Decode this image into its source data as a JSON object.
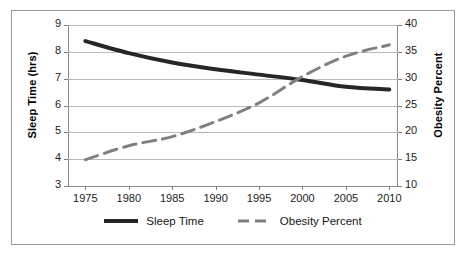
{
  "chart_data": {
    "type": "line",
    "title": "",
    "xlabel": "",
    "grid": true,
    "legend_position": "bottom",
    "x": [
      1975,
      1980,
      1985,
      1990,
      1995,
      2000,
      2005,
      2010
    ],
    "xlim": [
      1973,
      2011
    ],
    "xtick_labels": [
      "1975",
      "1980",
      "1985",
      "1990",
      "1995",
      "2000",
      "2005",
      "2010"
    ],
    "axes": [
      {
        "id": "left",
        "title": "Sleep Time (hrs)",
        "ylim": [
          3,
          9
        ],
        "ystep": 1,
        "ytick_labels": [
          "3",
          "4",
          "5",
          "6",
          "7",
          "8",
          "9"
        ]
      },
      {
        "id": "right",
        "title": "Obesity Percent",
        "ylim": [
          10,
          40
        ],
        "ystep": 5,
        "ytick_labels": [
          "10",
          "15",
          "20",
          "25",
          "30",
          "35",
          "40"
        ]
      }
    ],
    "series": [
      {
        "name": "Sleep Time",
        "axis": "left",
        "style": "solid",
        "color": "#262626",
        "width": 4,
        "values": [
          8.4,
          7.95,
          7.6,
          7.35,
          7.15,
          6.95,
          6.7,
          6.6
        ]
      },
      {
        "name": "Obesity Percent",
        "axis": "right",
        "style": "dashed",
        "color": "#808080",
        "width": 3,
        "values": [
          14.9,
          17.5,
          19.2,
          22.0,
          25.5,
          30.4,
          34.2,
          36.3
        ]
      }
    ],
    "legend": [
      {
        "label": "Sleep Time",
        "style": "solid",
        "color": "#262626"
      },
      {
        "label": "Obesity Percent",
        "style": "dashed",
        "color": "#808080"
      }
    ]
  }
}
